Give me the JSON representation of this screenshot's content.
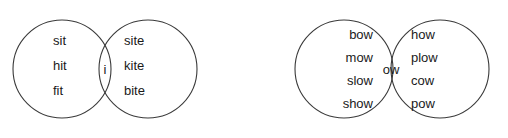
{
  "canvas": {
    "width": 508,
    "height": 138,
    "background_color": "#ffffff",
    "stroke_color": "#3a3a3a",
    "text_color": "#1a1a1a"
  },
  "diagrams": [
    {
      "name": "short-i-long-i-venn",
      "left_circle": {
        "cx": 62,
        "cy": 69,
        "r": 49
      },
      "right_circle": {
        "cx": 148,
        "cy": 69,
        "r": 49
      },
      "left_only": [
        "sit",
        "hit",
        "fit"
      ],
      "intersection": "i",
      "right_only": [
        "site",
        "kite",
        "bite"
      ]
    },
    {
      "name": "ow-sound-venn",
      "left_circle": {
        "cx": 344,
        "cy": 69,
        "r": 49
      },
      "right_circle": {
        "cx": 440,
        "cy": 69,
        "r": 49
      },
      "left_only": [
        "bow",
        "mow",
        "slow",
        "show"
      ],
      "intersection": "ow",
      "right_only": [
        "how",
        "plow",
        "cow",
        "pow"
      ]
    }
  ]
}
